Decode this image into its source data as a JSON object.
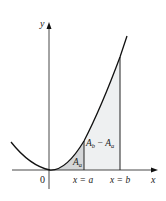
{
  "diagram": {
    "type": "area-under-curve",
    "axes": {
      "x_label": "x",
      "y_label": "y",
      "origin_label": "0"
    },
    "markers": {
      "a_label": "x = a",
      "b_label": "x = b"
    },
    "regions": {
      "small_area": {
        "label_main": "A",
        "label_sub": "a"
      },
      "difference_area": {
        "label_main1": "A",
        "label_sub1": "b",
        "minus": " − ",
        "label_main2": "A",
        "label_sub2": "a"
      }
    },
    "colors": {
      "curve": "#111111",
      "axes": "#333333",
      "shade_dark": "#d4d6d8",
      "shade_light": "#eef0f1"
    }
  }
}
